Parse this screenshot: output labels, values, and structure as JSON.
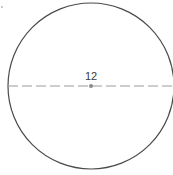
{
  "diagram": {
    "shape": "circle",
    "center": {
      "x": 91,
      "y": 86
    },
    "radius": 83,
    "stroke_color": "#4a4a4a",
    "diameter_line": {
      "style": "dashed",
      "x1": 8,
      "x2": 175,
      "y": 86,
      "color": "#9a9a9a"
    },
    "center_dot": {
      "x": 91,
      "y": 86,
      "r": 2,
      "color": "#8a8a8a"
    },
    "label": {
      "text": "12",
      "x": 91,
      "y": 80
    },
    "speck": {
      "x": 2,
      "y": 7,
      "color": "#8a8a8a"
    }
  }
}
